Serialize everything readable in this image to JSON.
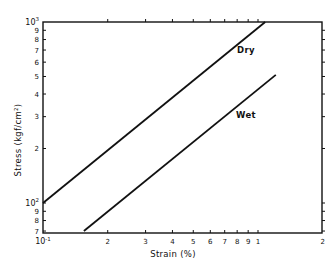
{
  "chart_data": {
    "type": "line",
    "title": "",
    "xlabel": "Strain (%)",
    "ylabel": "Stress (kgf/cm²)",
    "xscale": "log",
    "yscale": "log",
    "xlim": [
      0.1,
      2
    ],
    "ylim": [
      70,
      1000
    ],
    "grid": false,
    "legend": "inline labels",
    "x_ticks": [
      {
        "value": 0.1,
        "label": "10",
        "sup": "-1"
      },
      {
        "value": 0.2,
        "label": "2"
      },
      {
        "value": 0.3,
        "label": "3"
      },
      {
        "value": 0.4,
        "label": "4"
      },
      {
        "value": 0.5,
        "label": "5"
      },
      {
        "value": 0.6,
        "label": "6"
      },
      {
        "value": 0.7,
        "label": "7"
      },
      {
        "value": 0.8,
        "label": "8"
      },
      {
        "value": 0.9,
        "label": "9"
      },
      {
        "value": 1.0,
        "label": "1"
      },
      {
        "value": 2.0,
        "label": "2"
      }
    ],
    "y_ticks": [
      {
        "value": 70,
        "label": "7"
      },
      {
        "value": 80,
        "label": "8"
      },
      {
        "value": 90,
        "label": "9"
      },
      {
        "value": 100,
        "label": "10",
        "sup": "2"
      },
      {
        "value": 200,
        "label": "2"
      },
      {
        "value": 300,
        "label": "3"
      },
      {
        "value": 400,
        "label": "4"
      },
      {
        "value": 500,
        "label": "5"
      },
      {
        "value": 600,
        "label": "6"
      },
      {
        "value": 700,
        "label": "7"
      },
      {
        "value": 800,
        "label": "8"
      },
      {
        "value": 900,
        "label": "9"
      },
      {
        "value": 1000,
        "label": "10",
        "sup": "3"
      }
    ],
    "series": [
      {
        "name": "Dry",
        "x": [
          0.1,
          1.08
        ],
        "y": [
          100,
          1000
        ]
      },
      {
        "name": "Wet",
        "x": [
          0.155,
          1.21
        ],
        "y": [
          70,
          510
        ]
      }
    ]
  }
}
